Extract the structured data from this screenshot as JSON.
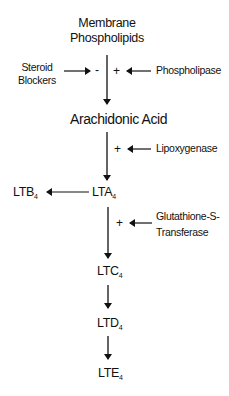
{
  "diagram": {
    "type": "flowchart",
    "nodes": {
      "membrane": {
        "line1": "Membrane",
        "line2": "Phospholipids"
      },
      "arachidonic": {
        "label": "Arachidonic Acid"
      },
      "lta4": {
        "base": "LTA",
        "sub": "4"
      },
      "ltb4": {
        "base": "LTB",
        "sub": "4"
      },
      "ltc4": {
        "base": "LTC",
        "sub": "4"
      },
      "ltd4": {
        "base": "LTD",
        "sub": "4"
      },
      "lte4": {
        "base": "LTE",
        "sub": "4"
      }
    },
    "modifiers": {
      "steroid": {
        "line1": "Steroid",
        "line2": "Blockers",
        "sign": "-"
      },
      "phospholipase": {
        "label": "Phospholipase",
        "sign": "+"
      },
      "lipoxygenase": {
        "label": "Lipoxygenase",
        "sign": "+"
      },
      "gst": {
        "line1": "Glutathione-S-",
        "line2": "Transferase",
        "sign": "+"
      }
    },
    "edges": [
      {
        "from": "Membrane Phospholipids",
        "to": "Arachidonic Acid"
      },
      {
        "from": "Arachidonic Acid",
        "to": "LTA4"
      },
      {
        "from": "LTA4",
        "to": "LTB4"
      },
      {
        "from": "LTA4",
        "to": "LTC4"
      },
      {
        "from": "LTC4",
        "to": "LTD4"
      },
      {
        "from": "LTD4",
        "to": "LTE4"
      }
    ],
    "colors": {
      "ink": "#111111",
      "background": "#ffffff"
    }
  }
}
